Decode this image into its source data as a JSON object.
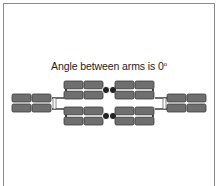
{
  "caption": {
    "text": "Angle between arms is 0",
    "degree_symbol": "o"
  },
  "diagram": {
    "panel_color": "#6f6f6f",
    "panel_stroke": "#3a3a3a",
    "hinge_color": "#222222",
    "angle_deg": 0
  }
}
